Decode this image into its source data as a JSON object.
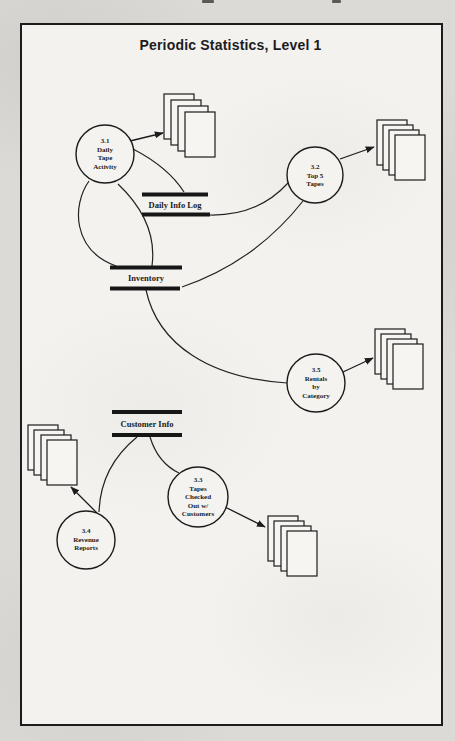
{
  "title": "Periodic Statistics, Level 1",
  "colors": {
    "ink": "#1c1c1c",
    "paper": "#f3f2ef",
    "scan_background": "#dbdad7"
  },
  "processes": [
    {
      "id": "3.1",
      "label": "3.1\nDaily\nTape\nActivity"
    },
    {
      "id": "3.2",
      "label": "3.2\nTop 5\nTapes"
    },
    {
      "id": "3.5",
      "label": "3.5\nRentals\nby\nCategory"
    },
    {
      "id": "3.3",
      "label": "3.3\nTapes\nChecked\nOut w/\nCustomers"
    },
    {
      "id": "3.4",
      "label": "3.4\nRevenue\nReports"
    }
  ],
  "datastores": [
    {
      "label": "Daily Info Log"
    },
    {
      "label": "Inventory"
    },
    {
      "label": "Customer Info"
    }
  ],
  "icons": {
    "output_stack": "document-stack"
  },
  "flows": [
    {
      "from": "3.1 Daily Tape Activity",
      "to": "output documents"
    },
    {
      "from": "3.1 Daily Tape Activity",
      "to": "Daily Info Log"
    },
    {
      "from": "3.1 Daily Tape Activity",
      "to": "Inventory"
    },
    {
      "from": "3.1 Daily Tape Activity",
      "to": "Inventory"
    },
    {
      "from": "Daily Info Log",
      "to": "3.2 Top 5 Tapes"
    },
    {
      "from": "Inventory",
      "to": "3.2 Top 5 Tapes"
    },
    {
      "from": "Inventory",
      "to": "3.5 Rentals by Category"
    },
    {
      "from": "3.2 Top 5 Tapes",
      "to": "output documents"
    },
    {
      "from": "3.5 Rentals by Category",
      "to": "output documents"
    },
    {
      "from": "Customer Info",
      "to": "3.4 Revenue Reports"
    },
    {
      "from": "Customer Info",
      "to": "3.3 Tapes Checked Out w/ Customers"
    },
    {
      "from": "3.4 Revenue Reports",
      "to": "output documents"
    },
    {
      "from": "3.3 Tapes Checked Out w/ Customers",
      "to": "output documents"
    }
  ]
}
